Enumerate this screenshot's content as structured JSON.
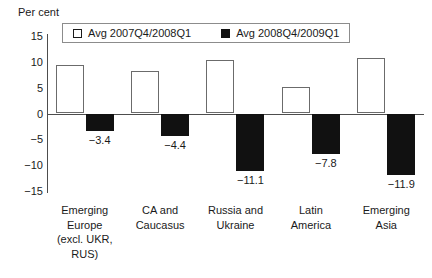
{
  "chart_data": {
    "type": "bar",
    "title": "",
    "ylabel": "Per cent",
    "xlabel": "",
    "ylim": [
      -15,
      15
    ],
    "yticks": [
      15,
      10,
      5,
      0,
      -5,
      -10,
      -15
    ],
    "ytick_labels": [
      "15",
      "10",
      "5",
      "0",
      "−5",
      "−10",
      "−15"
    ],
    "grid": false,
    "legend_position": "top-center",
    "categories": [
      "Emerging Europe (excl. UKR, RUS)",
      "CA and Caucasus",
      "Russia and Ukraine",
      "Latin America",
      "Emerging Asia"
    ],
    "category_lines": [
      [
        "Emerging",
        "Europe",
        "(excl. UKR,",
        "RUS)"
      ],
      [
        "CA and",
        "Caucasus"
      ],
      [
        "Russia and",
        "Ukraine"
      ],
      [
        "Latin",
        "America"
      ],
      [
        "Emerging",
        "Asia"
      ]
    ],
    "series": [
      {
        "name": "Avg 2007Q4/2008Q1",
        "color": "#ffffff",
        "values": [
          9.3,
          8.3,
          10.4,
          5.2,
          10.8
        ],
        "value_labels": [
          "",
          "",
          "",
          "",
          ""
        ]
      },
      {
        "name": "Avg 2008Q4/2009Q1",
        "color": "#111111",
        "values": [
          -3.4,
          -4.4,
          -11.1,
          -7.8,
          -11.9
        ],
        "value_labels": [
          "−3.4",
          "−4.4",
          "−11.1",
          "−7.8",
          "−11.9"
        ]
      }
    ]
  },
  "legend": {
    "entries": [
      {
        "label": "Avg 2007Q4/2008Q1",
        "swatch": "open"
      },
      {
        "label": "Avg 2008Q4/2009Q1",
        "swatch": "filled"
      }
    ]
  },
  "axis": {
    "y_title": "Per cent"
  }
}
